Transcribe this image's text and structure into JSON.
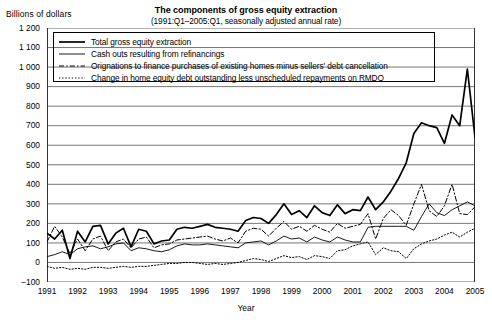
{
  "chart_data": {
    "type": "line",
    "title": "The components of gross equity extraction",
    "subtitle": "(1991:Q1–2005:Q1, seasonally adjusted annual rate)",
    "ylabel": "Billions of dollars",
    "xlabel": "Year",
    "ylim": [
      -100,
      1200
    ],
    "ytick_labels": [
      "1 200",
      "1 100",
      "1 000",
      "900",
      "800",
      "700",
      "600",
      "500",
      "400",
      "300",
      "200",
      "100",
      "0",
      "−100"
    ],
    "ytick_values": [
      1200,
      1100,
      1000,
      900,
      800,
      700,
      600,
      500,
      400,
      300,
      200,
      100,
      0,
      -100
    ],
    "xlim": [
      1991.0,
      2005.0
    ],
    "xtick_labels": [
      "1991",
      "1992",
      "1993",
      "1994",
      "1995",
      "1996",
      "1997",
      "1998",
      "1999",
      "2000",
      "2001",
      "2002",
      "2003",
      "2004",
      "2005"
    ],
    "xtick_values": [
      1991,
      1992,
      1993,
      1994,
      1995,
      1996,
      1997,
      1998,
      1999,
      2000,
      2001,
      2002,
      2003,
      2004,
      2005
    ],
    "grid": "horizontal",
    "legend_position": "upper-left-inside",
    "x_quarters": [
      1991.0,
      1991.25,
      1991.5,
      1991.75,
      1992.0,
      1992.25,
      1992.5,
      1992.75,
      1993.0,
      1993.25,
      1993.5,
      1993.75,
      1994.0,
      1994.25,
      1994.5,
      1994.75,
      1995.0,
      1995.25,
      1995.5,
      1995.75,
      1996.0,
      1996.25,
      1996.5,
      1996.75,
      1997.0,
      1997.25,
      1997.5,
      1997.75,
      1998.0,
      1998.25,
      1998.5,
      1998.75,
      1999.0,
      1999.25,
      1999.5,
      1999.75,
      2000.0,
      2000.25,
      2000.5,
      2000.75,
      2001.0,
      2001.25,
      2001.5,
      2001.75,
      2002.0,
      2002.25,
      2002.5,
      2002.75,
      2003.0,
      2003.25,
      2003.5,
      2003.75,
      2004.0,
      2004.25,
      2004.5,
      2004.75,
      2005.0
    ],
    "series": [
      {
        "name": "Total gross equity extraction",
        "style": "solid-thick",
        "values": [
          150,
          120,
          165,
          20,
          160,
          105,
          185,
          190,
          95,
          150,
          175,
          80,
          170,
          160,
          95,
          110,
          115,
          170,
          180,
          175,
          185,
          195,
          180,
          175,
          170,
          160,
          215,
          230,
          225,
          200,
          245,
          300,
          245,
          265,
          230,
          290,
          255,
          240,
          295,
          250,
          270,
          265,
          335,
          270,
          310,
          365,
          430,
          510,
          660,
          715,
          700,
          690,
          610,
          755,
          700,
          990,
          640
        ]
      },
      {
        "name": "Cash outs resulting from refinancings",
        "style": "solid-thin",
        "values": [
          30,
          40,
          55,
          40,
          70,
          80,
          85,
          70,
          80,
          95,
          100,
          60,
          75,
          70,
          60,
          55,
          65,
          85,
          95,
          90,
          90,
          95,
          90,
          85,
          80,
          75,
          100,
          105,
          110,
          90,
          110,
          135,
          120,
          125,
          105,
          130,
          115,
          105,
          130,
          115,
          105,
          105,
          180,
          185,
          185,
          185,
          185,
          185,
          165,
          235,
          300,
          255,
          240,
          270,
          290,
          310,
          290
        ]
      },
      {
        "name": "Orignations to finance purchases of existing homes minus sellers' debt cancellation",
        "style": "dash-dot",
        "values": [
          105,
          185,
          130,
          45,
          120,
          60,
          120,
          135,
          60,
          105,
          120,
          75,
          120,
          130,
          75,
          90,
          95,
          115,
          120,
          125,
          130,
          135,
          120,
          110,
          125,
          100,
          160,
          175,
          170,
          135,
          175,
          210,
          170,
          185,
          160,
          190,
          170,
          155,
          200,
          175,
          185,
          195,
          250,
          120,
          225,
          270,
          240,
          190,
          300,
          400,
          265,
          235,
          290,
          400,
          250,
          245,
          285
        ]
      },
      {
        "name": "Change in home equity debt outstanding less unscheduled repayments on RMDO",
        "style": "dotted",
        "values": [
          -20,
          -30,
          -25,
          -35,
          -30,
          -35,
          -25,
          -25,
          -30,
          -25,
          -20,
          -25,
          -20,
          -20,
          -15,
          -10,
          -5,
          -5,
          0,
          0,
          -5,
          -10,
          -5,
          -10,
          -5,
          0,
          10,
          20,
          15,
          5,
          20,
          35,
          25,
          30,
          15,
          35,
          30,
          20,
          60,
          65,
          85,
          95,
          105,
          40,
          75,
          60,
          55,
          20,
          70,
          95,
          110,
          120,
          140,
          155,
          130,
          155,
          175
        ]
      }
    ]
  },
  "legend": {
    "items": [
      {
        "label": "Total gross equity extraction",
        "style": "solid-thick"
      },
      {
        "label": "Cash outs resulting from refinancings",
        "style": "solid-thin"
      },
      {
        "label": "Orignations to finance purchases of existing homes minus sellers' debt cancellation",
        "style": "dash-dot"
      },
      {
        "label": "Change in home equity debt outstanding less unscheduled repayments on RMDO",
        "style": "dotted"
      }
    ]
  }
}
